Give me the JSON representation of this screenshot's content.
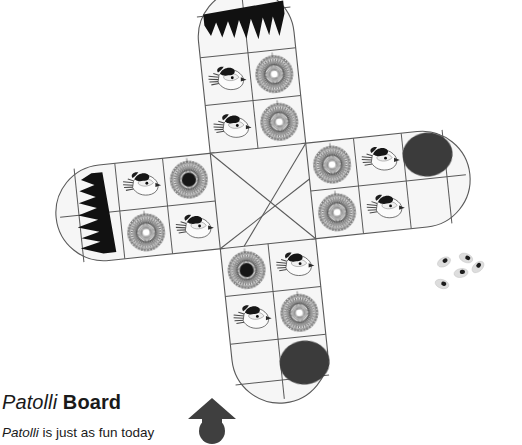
{
  "figure": {
    "caption_term": "Patolli",
    "caption_kind": "Board",
    "subtitle_term": "Patolli",
    "subtitle_rest": " is just as fun today",
    "alt_name": "patolli-board-illustration"
  },
  "palette": {
    "board_fill": "#f7f7f7",
    "cell_fill": "#f2f2f2",
    "outline": "#5a5a5a",
    "motif_dark": "#111111",
    "goal_circle": "#3a3a3a",
    "arrow": "#3f3f3f",
    "bean_fill": "#dcdcdc",
    "bean_mark": "#1c1c1c",
    "text": "#1a1a1a"
  },
  "board": {
    "name": "patolli-cross-board",
    "shape": "cross",
    "arms": [
      {
        "name": "arm-top",
        "direction": "up",
        "end_marker": "black-jagged-crown",
        "end_marker_rotation_deg": 0,
        "cells": [
          {
            "row": 1,
            "col": "left",
            "motif": "crown-banner"
          },
          {
            "row": 1,
            "col": "right",
            "motif": "crown-banner"
          },
          {
            "row": 2,
            "col": "left",
            "motif": "bird"
          },
          {
            "row": 2,
            "col": "right",
            "motif": "starburst"
          },
          {
            "row": 3,
            "col": "left",
            "motif": "bird"
          },
          {
            "row": 3,
            "col": "right",
            "motif": "starburst"
          }
        ]
      },
      {
        "name": "arm-right",
        "direction": "right",
        "end_marker": "dark-circle",
        "cells": [
          {
            "row": 1,
            "col": "inner",
            "motif": "starburst"
          },
          {
            "row": 1,
            "col": "mid",
            "motif": "bird"
          },
          {
            "row": 1,
            "col": "outer",
            "motif": "dark-circle"
          },
          {
            "row": 2,
            "col": "inner",
            "motif": "starburst"
          },
          {
            "row": 2,
            "col": "mid",
            "motif": "bird"
          },
          {
            "row": 2,
            "col": "outer",
            "motif": "blank"
          }
        ]
      },
      {
        "name": "arm-bottom",
        "direction": "down",
        "end_marker": "dark-circle",
        "cells": [
          {
            "row": 1,
            "col": "left",
            "motif": "starburst-dark-center"
          },
          {
            "row": 1,
            "col": "right",
            "motif": "bird"
          },
          {
            "row": 2,
            "col": "left",
            "motif": "bird"
          },
          {
            "row": 2,
            "col": "right",
            "motif": "starburst"
          },
          {
            "row": 3,
            "col": "left",
            "motif": "blank"
          },
          {
            "row": 3,
            "col": "right",
            "motif": "dark-circle"
          }
        ]
      },
      {
        "name": "arm-left",
        "direction": "left",
        "end_marker": "black-jagged-crown",
        "end_marker_rotation_deg": 90,
        "cells": [
          {
            "row": 1,
            "col": "outer",
            "motif": "crown-banner"
          },
          {
            "row": 1,
            "col": "mid",
            "motif": "bird"
          },
          {
            "row": 1,
            "col": "inner",
            "motif": "starburst-dark-center"
          },
          {
            "row": 2,
            "col": "outer",
            "motif": "crown-banner"
          },
          {
            "row": 2,
            "col": "mid",
            "motif": "starburst"
          },
          {
            "row": 2,
            "col": "inner",
            "motif": "bird"
          }
        ]
      }
    ],
    "center": {
      "name": "center-square",
      "decoration": "diagonal-x-lines"
    },
    "motif_counts": {
      "bird": 8,
      "starburst": 6,
      "starburst_dark_center": 2,
      "dark_circle": 2,
      "jagged_crown": 2
    }
  },
  "dice": {
    "name": "patolli-beans",
    "count": 5,
    "label": "bean-dice"
  }
}
